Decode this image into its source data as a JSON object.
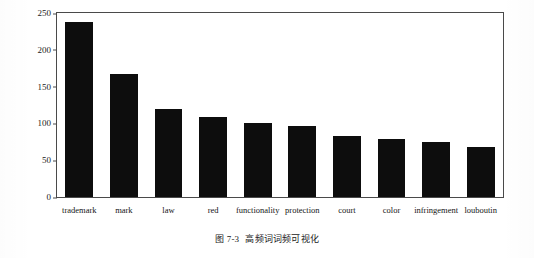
{
  "figure": {
    "caption_number": "图 7-3",
    "caption_text": "高频词词频可视化"
  },
  "chart_data": {
    "type": "bar",
    "title": "",
    "xlabel": "",
    "ylabel": "",
    "ylim": [
      0,
      250
    ],
    "yticks": [
      0,
      50,
      100,
      150,
      200,
      250
    ],
    "grid": false,
    "legend": "none",
    "categories": [
      "trademark",
      "mark",
      "law",
      "red",
      "functionality",
      "protection",
      "court",
      "color",
      "infringement",
      "louboutin"
    ],
    "values": [
      238,
      167,
      120,
      109,
      101,
      97,
      83,
      79,
      75,
      68
    ]
  }
}
